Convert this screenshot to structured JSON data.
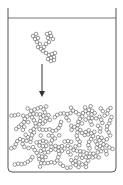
{
  "diagram": {
    "title": "",
    "colors": {
      "stroke": "#555555",
      "particle_fill": "#ffffff",
      "background": "#ffffff"
    },
    "elements": [
      {
        "name": "container",
        "kind": "beaker"
      },
      {
        "name": "liquid-surface",
        "kind": "line"
      },
      {
        "name": "falling-cluster",
        "kind": "particle-aggregate"
      },
      {
        "name": "settling-arrow",
        "kind": "arrow",
        "direction": "down"
      },
      {
        "name": "sediment-layer",
        "kind": "particle-aggregate"
      }
    ]
  }
}
